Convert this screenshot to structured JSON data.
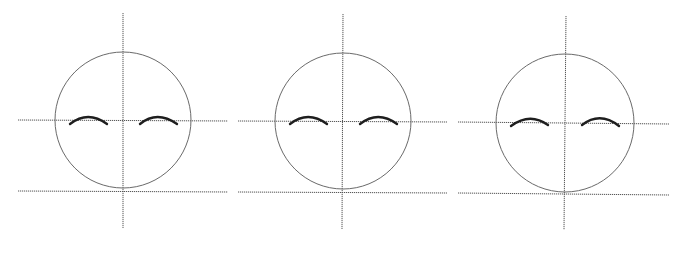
{
  "diagram": {
    "type": "face-construction-guide",
    "colors": {
      "background": "#ffffff",
      "guide_line": "#555555",
      "head_outline": "#6a6a6a",
      "eyebrow": "#1e1e1e"
    },
    "panels": [
      {
        "id": "panel-1",
        "head": {
          "cx": 123,
          "cy": 120,
          "r": 68
        },
        "vertical_guide": {
          "x1": 123,
          "y1": 13,
          "x2": 123,
          "y2": 228
        },
        "eye_line": {
          "x1": 18,
          "y1": 120,
          "x2": 228,
          "y2": 121
        },
        "chin_line": {
          "x1": 18,
          "y1": 191,
          "x2": 228,
          "y2": 192
        },
        "left_brow": {
          "x1": 70,
          "y1": 124,
          "cx": 88,
          "cy": 110,
          "x2": 107,
          "y2": 124
        },
        "right_brow": {
          "x1": 140,
          "y1": 124,
          "cx": 157,
          "cy": 110,
          "x2": 177,
          "y2": 124
        }
      },
      {
        "id": "panel-2",
        "head": {
          "cx": 343,
          "cy": 121,
          "r": 68
        },
        "vertical_guide": {
          "x1": 343,
          "y1": 14,
          "x2": 342,
          "y2": 229
        },
        "eye_line": {
          "x1": 238,
          "y1": 121,
          "x2": 447,
          "y2": 122
        },
        "chin_line": {
          "x1": 238,
          "y1": 192,
          "x2": 447,
          "y2": 193
        },
        "left_brow": {
          "x1": 290,
          "y1": 124,
          "cx": 308,
          "cy": 110,
          "x2": 327,
          "y2": 124
        },
        "right_brow": {
          "x1": 360,
          "y1": 124,
          "cx": 378,
          "cy": 110,
          "x2": 397,
          "y2": 124
        }
      },
      {
        "id": "panel-3",
        "head": {
          "cx": 565,
          "cy": 123,
          "r": 69
        },
        "vertical_guide": {
          "x1": 566,
          "y1": 16,
          "x2": 564,
          "y2": 230
        },
        "eye_line": {
          "x1": 458,
          "y1": 122,
          "x2": 669,
          "y2": 124
        },
        "chin_line": {
          "x1": 458,
          "y1": 193,
          "x2": 669,
          "y2": 195
        },
        "left_brow": {
          "x1": 511,
          "y1": 126,
          "cx": 530,
          "cy": 112,
          "x2": 548,
          "y2": 125
        },
        "right_brow": {
          "x1": 582,
          "y1": 125,
          "cx": 600,
          "cy": 111,
          "x2": 619,
          "y2": 126
        }
      }
    ]
  }
}
